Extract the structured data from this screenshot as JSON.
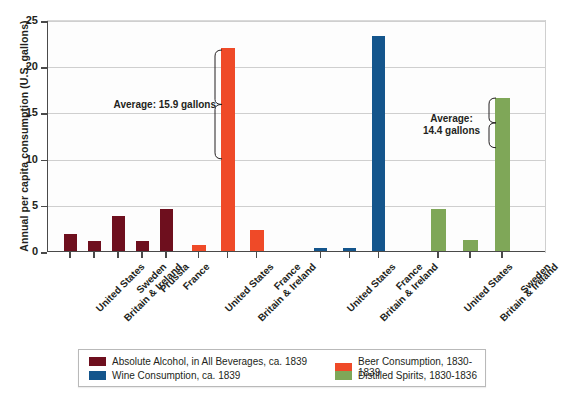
{
  "chart_data": {
    "type": "bar",
    "title": "",
    "xlabel": "",
    "ylabel": "Annual per capita consumption (U.S. gallons)",
    "ylim": [
      0,
      25
    ],
    "y_ticks": [
      0,
      5,
      10,
      15,
      20,
      25
    ],
    "grid": "horizontal",
    "legend_position": "bottom",
    "groups": [
      {
        "series_name": "Absolute Alcohol, in All Beverages, ca. 1839",
        "color": "#6e0f1e",
        "categories": [
          "United States",
          "Britain & Ireland",
          "Sweden",
          "Prussia",
          "France"
        ],
        "values": [
          1.8,
          1.1,
          3.8,
          1.1,
          4.5
        ]
      },
      {
        "series_name": "Beer Consumption, 1830-1839",
        "color": "#ef4a28",
        "categories": [
          "United States",
          "Britain & Ireland",
          "France"
        ],
        "values": [
          0.6,
          22.0,
          2.3
        ]
      },
      {
        "series_name": "Wine Consumption, ca. 1839",
        "color": "#14558c",
        "categories": [
          "United States",
          "Britain & Ireland",
          "France"
        ],
        "values": [
          0.3,
          0.3,
          23.3
        ]
      },
      {
        "series_name": "Distilled Spirits, 1830-1836",
        "color": "#7fa758",
        "categories": [
          "United States",
          "Britain & Ireland",
          "Sweden"
        ],
        "values": [
          4.6,
          1.2,
          16.6
        ]
      }
    ],
    "annotations": [
      {
        "text": "Average: 15.9 gallons",
        "group": 1,
        "value": 15.9
      },
      {
        "text": "Average:\n14.4 gallons",
        "group": 3,
        "value": 14.4
      }
    ]
  },
  "axis": {
    "y_title": "Annual per capita consumption (U.S. gallons)",
    "y_tick_labels": [
      "0",
      "5",
      "10",
      "15",
      "20",
      "25"
    ]
  },
  "annotations": {
    "beer_average": "Average: 15.9 gallons",
    "spirits_average_line1": "Average:",
    "spirits_average_line2": "14.4 gallons"
  },
  "categories": {
    "g0": [
      "United States",
      "Britain & Ireland",
      "Sweden",
      "Prussia",
      "France"
    ],
    "g1": [
      "United States",
      "Britain & Ireland",
      "France"
    ],
    "g2": [
      "United States",
      "Britain & Ireland",
      "France"
    ],
    "g3": [
      "United States",
      "Britain & Ireland",
      "Sweden"
    ]
  },
  "legend": {
    "items": [
      {
        "label": "Absolute Alcohol, in All Beverages, ca. 1839",
        "color": "#6e0f1e"
      },
      {
        "label": "Wine Consumption, ca. 1839",
        "color": "#14558c"
      },
      {
        "label": "Beer Consumption, 1830-1839",
        "color": "#ef4a28"
      },
      {
        "label": "Distilled Spirits, 1830-1836",
        "color": "#7fa758"
      }
    ]
  },
  "caption": ""
}
